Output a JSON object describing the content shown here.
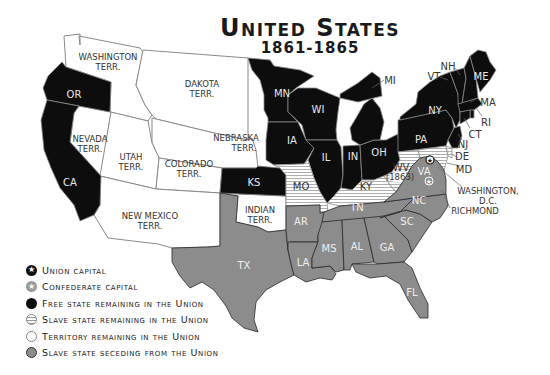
{
  "title": {
    "main": "United States",
    "sub": "1861-1865"
  },
  "colors": {
    "free_state": "#0d0d0d",
    "slave_union": "#ffffff",
    "slave_union_stripe": "#9a9a9a",
    "territory": "#ffffff",
    "seceding": "#8c8c8c",
    "border": "#8a8a8a",
    "label_dark_bg": "#e8e8e8",
    "label_light_bg": "#333333"
  },
  "map": {
    "territories": {
      "washington": {
        "line1": "WASHINGTON",
        "line2": "TERR."
      },
      "dakota": {
        "line1": "DAKOTA",
        "line2": "TERR."
      },
      "nebraska": {
        "line1": "NEBRASKA",
        "line2": "TERR."
      },
      "nevada": {
        "line1": "NEVADA",
        "line2": "TERR."
      },
      "utah": {
        "line1": "UTAH",
        "line2": "TERR."
      },
      "colorado": {
        "line1": "COLORADO",
        "line2": "TERR."
      },
      "new_mexico": {
        "line1": "NEW MEXICO",
        "line2": "TERR."
      },
      "indian": {
        "line1": "INDIAN",
        "line2": "TERR."
      }
    },
    "free_states": {
      "or": "OR",
      "ca": "CA",
      "mn": "MN",
      "wi": "WI",
      "ia": "IA",
      "ks": "KS",
      "il": "IL",
      "in": "IN",
      "oh": "OH",
      "mi": "MI",
      "pa": "PA",
      "ny": "NY",
      "vt": "VT",
      "nh": "NH",
      "me": "ME",
      "ma": "MA",
      "ri": "RI",
      "ct": "CT",
      "nj": "NJ",
      "wv": "WV",
      "wv_year": "(1863)"
    },
    "slave_union_states": {
      "mo": "MO",
      "ky": "KY",
      "de": "DE",
      "md": "MD"
    },
    "seceding_states": {
      "tx": "TX",
      "ar": "AR",
      "la": "LA",
      "tn": "TN",
      "ms": "MS",
      "al": "AL",
      "ga": "GA",
      "sc": "SC",
      "nc": "NC",
      "va": "VA",
      "fl": "FL"
    },
    "cities": {
      "washington_line1": "WASHINGTON,",
      "washington_line2": "D.C.",
      "richmond": "RICHMOND"
    }
  },
  "legend": {
    "items": [
      {
        "icon": "union-capital-star-icon",
        "label": "Union capital"
      },
      {
        "icon": "confederate-capital-star-icon",
        "label": "Confederate capital"
      },
      {
        "icon": "free-state-swatch-icon",
        "label": "Free state remaining in the Union"
      },
      {
        "icon": "slave-union-swatch-icon",
        "label": "Slave state remaining in the Union"
      },
      {
        "icon": "territory-swatch-icon",
        "label": "Territory remaining in the Union"
      },
      {
        "icon": "seceding-swatch-icon",
        "label": "Slave state seceding from the Union"
      }
    ]
  }
}
